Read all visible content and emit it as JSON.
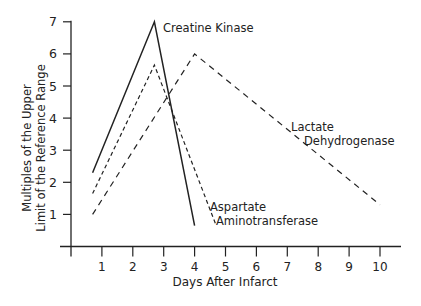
{
  "chart_data": {
    "type": "line",
    "title": "",
    "xlabel": "Days After Infarct",
    "ylabel_line1": "Multiples of the Upper",
    "ylabel_line2": "Limit of the Reference Range",
    "xlim": [
      0,
      10.8
    ],
    "ylim": [
      0,
      7
    ],
    "x_ticks": [
      1,
      2,
      3,
      4,
      5,
      6,
      7,
      8,
      9,
      10
    ],
    "y_ticks": [
      1,
      2,
      3,
      4,
      5,
      6,
      7
    ],
    "grid": false,
    "legend": "inline annotations",
    "series": [
      {
        "name": "Creatine Kinase",
        "style": "solid",
        "points": [
          [
            0.7,
            2.3
          ],
          [
            2.7,
            7.0
          ],
          [
            4.0,
            0.65
          ]
        ],
        "label_lines": [
          "Creatine Kinase"
        ]
      },
      {
        "name": "Aspartate Aminotransferase",
        "style": "dotted",
        "points": [
          [
            0.7,
            1.65
          ],
          [
            2.7,
            5.65
          ],
          [
            4.7,
            0.65
          ]
        ],
        "label_lines": [
          "Aspartate",
          "Aminotransferase"
        ]
      },
      {
        "name": "Lactate Dehydrogenase",
        "style": "dashed",
        "points": [
          [
            0.7,
            1.0
          ],
          [
            4.0,
            6.0
          ],
          [
            10.0,
            1.3
          ]
        ],
        "label_lines": [
          "Lactate",
          "Dehydrogenase"
        ]
      }
    ]
  }
}
